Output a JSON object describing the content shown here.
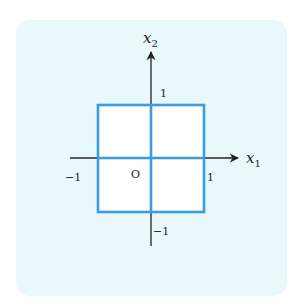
{
  "diagram": {
    "axes": {
      "x_label": "x",
      "x_sub": "1",
      "y_label": "x",
      "y_sub": "2",
      "origin_label": "O"
    },
    "ticks": {
      "x_pos": "1",
      "x_neg": "−1",
      "y_pos": "1",
      "y_neg": "−1"
    },
    "shape": {
      "type": "square",
      "x_range": [
        -1,
        1
      ],
      "y_range": [
        -1,
        1
      ],
      "stroke_color": "#3a9de0"
    },
    "colors": {
      "panel_bg": "#e8f8fb",
      "square_fill": "#ffffff",
      "axis": "#222222"
    }
  }
}
